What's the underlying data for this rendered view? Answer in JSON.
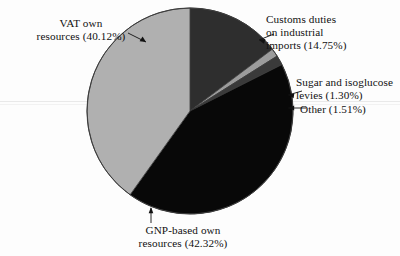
{
  "chart_data": {
    "type": "pie",
    "title": "",
    "subtitle": "",
    "xlabel": "",
    "ylabel": "",
    "legend_position": "none",
    "grid": false,
    "start_angle_deg": 0,
    "direction": "clockwise",
    "center": {
      "x": 190,
      "y": 111
    },
    "radius": 103,
    "categories": [
      "Customs duties on industrial imports",
      "Sugar and isoglucose levies",
      "Other",
      "GNP-based own resources",
      "VAT own resources"
    ],
    "values": [
      14.75,
      1.3,
      1.51,
      42.32,
      40.12
    ],
    "unit": "%",
    "total": 100.0,
    "slices": [
      {
        "key": "customs",
        "label_lines": [
          "Customs duties",
          "on industrial",
          "imports (14.75%)"
        ],
        "label_text": "Customs duties on industrial imports (14.75%)",
        "value": 14.75,
        "value_text": "14.75%",
        "color": "#2e2e2e"
      },
      {
        "key": "sugar",
        "label_lines": [
          "Sugar and isoglucose",
          "levies (1.30%)"
        ],
        "label_text": "Sugar and isoglucose levies (1.30%)",
        "value": 1.3,
        "value_text": "1.30%",
        "color": "#9c9c9c"
      },
      {
        "key": "other",
        "label_lines": [
          "Other (1.51%)"
        ],
        "label_text": "Other (1.51%)",
        "value": 1.51,
        "value_text": "1.51%",
        "color": "#3a3a3a"
      },
      {
        "key": "gnp",
        "label_lines": [
          "GNP-based own",
          "resources (42.32%)"
        ],
        "label_text": "GNP-based own resources (42.32%)",
        "value": 42.32,
        "value_text": "42.32%",
        "color": "#080808"
      },
      {
        "key": "vat",
        "label_lines": [
          "VAT own",
          "resources (40.12%)"
        ],
        "label_text": "VAT own resources (40.12%)",
        "value": 40.12,
        "value_text": "40.12%",
        "color": "#b0b0b0"
      }
    ],
    "colors": {
      "customs": "#2e2e2e",
      "sugar": "#9c9c9c",
      "other": "#3a3a3a",
      "gnp": "#080808",
      "vat": "#b0b0b0",
      "outline": "#3b3b3b",
      "background": "#fdfdfd",
      "text": "#111111"
    }
  },
  "labels": {
    "vat": {
      "line1": "VAT own",
      "line2": "resources (40.12%)"
    },
    "customs": {
      "line1": "Customs duties",
      "line2": "on industrial",
      "line3": "imports (14.75%)"
    },
    "sugar": {
      "line1": "Sugar and isoglucose",
      "line2": "levies (1.30%)"
    },
    "other": {
      "line1": "Other (1.51%)"
    },
    "gnp": {
      "line1": "GNP-based own",
      "line2": "resources (42.32%)"
    }
  }
}
